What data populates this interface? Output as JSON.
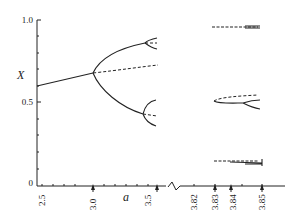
{
  "figure": {
    "type": "bifurcation-diagram",
    "y_axis": {
      "label": "X",
      "ticks": [
        "1.0",
        "0.5",
        "0"
      ]
    },
    "x_axis": {
      "label": "a",
      "ticks_left": [
        "2.5",
        "3.0",
        "3.5"
      ],
      "ticks_right": [
        "3.82",
        "3.83",
        "3.84",
        "3.85"
      ]
    },
    "line_color": "#222222"
  }
}
